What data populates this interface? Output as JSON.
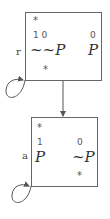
{
  "nodes": [
    {
      "id": "r",
      "label": "r",
      "top_marker": "*",
      "left": {
        "index": "1 0",
        "value": "~~P"
      },
      "right": {
        "index": "0",
        "value": "P"
      },
      "bottom_marker": "*"
    },
    {
      "id": "a",
      "label": "a",
      "top_marker": "*",
      "left": {
        "index": "1",
        "value": "P"
      },
      "right": {
        "index": "0",
        "value": "~P"
      },
      "bottom_marker": "*"
    }
  ],
  "edges": [
    {
      "from": "r",
      "to": "r",
      "type": "self-loop"
    },
    {
      "from": "r",
      "to": "a",
      "type": "arrow"
    },
    {
      "from": "a",
      "to": "a",
      "type": "self-loop"
    }
  ],
  "colors": {
    "line": "#666666",
    "text": "#333333"
  }
}
